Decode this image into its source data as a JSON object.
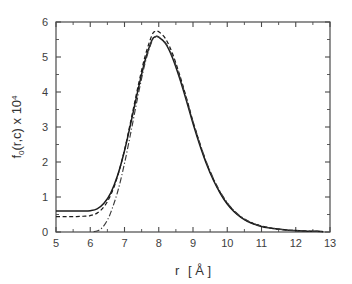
{
  "chart_data": {
    "type": "line",
    "title": "",
    "xlabel": "r [ Å ]",
    "ylabel": "f0(r,c) x 104",
    "ylabel_parts": {
      "base": "f",
      "sub": "0",
      "mid": "(r,c) x 10",
      "sup": "4"
    },
    "xlabel_parts": {
      "var": "r",
      "unit": "[ Å ]"
    },
    "xlim": [
      5,
      13
    ],
    "ylim": [
      0,
      6
    ],
    "xticks": [
      5,
      6,
      7,
      8,
      9,
      10,
      11,
      12,
      13
    ],
    "yticks": [
      0,
      1,
      2,
      3,
      4,
      5,
      6
    ],
    "xticklabels": [
      "5",
      "6",
      "7",
      "8",
      "9",
      "10",
      "11",
      "12",
      "13"
    ],
    "yticklabels": [
      "0",
      "1",
      "2",
      "3",
      "4",
      "5",
      "6"
    ],
    "x_minor_step": 0.5,
    "y_minor_step": 0.5,
    "grid": false,
    "legend": "none",
    "frame": "box",
    "accent_color": "#1c1c1c",
    "background_color": "#ffffff",
    "series": [
      {
        "name": "solid",
        "style": "solid",
        "color": "#1c1c1c",
        "x": [
          5.0,
          5.2,
          5.4,
          5.6,
          5.8,
          6.0,
          6.2,
          6.4,
          6.6,
          6.8,
          7.0,
          7.2,
          7.4,
          7.6,
          7.8,
          7.9,
          8.0,
          8.2,
          8.4,
          8.6,
          8.8,
          9.0,
          9.2,
          9.4,
          9.6,
          9.8,
          10.0,
          10.2,
          10.4,
          10.6,
          10.8,
          11.0,
          11.2,
          11.4,
          11.6,
          11.8,
          12.0,
          12.2,
          12.4,
          12.6,
          12.8
        ],
        "y": [
          0.6,
          0.6,
          0.6,
          0.6,
          0.6,
          0.61,
          0.66,
          0.82,
          1.12,
          1.62,
          2.32,
          3.18,
          4.08,
          4.9,
          5.48,
          5.58,
          5.57,
          5.38,
          4.98,
          4.42,
          3.78,
          3.1,
          2.48,
          1.93,
          1.47,
          1.1,
          0.8,
          0.58,
          0.42,
          0.3,
          0.22,
          0.16,
          0.12,
          0.09,
          0.07,
          0.05,
          0.04,
          0.03,
          0.02,
          0.02,
          0.01
        ]
      },
      {
        "name": "dashed",
        "style": "dashed",
        "color": "#1c1c1c",
        "x": [
          5.0,
          5.2,
          5.4,
          5.6,
          5.8,
          6.0,
          6.2,
          6.4,
          6.6,
          6.8,
          7.0,
          7.2,
          7.4,
          7.6,
          7.8,
          7.9,
          8.0,
          8.2,
          8.4,
          8.6,
          8.8,
          9.0,
          9.2,
          9.4,
          9.6,
          9.8,
          10.0,
          10.2,
          10.4,
          10.6,
          10.8,
          11.0,
          11.2,
          11.4,
          11.6,
          11.8,
          12.0,
          12.2,
          12.4,
          12.6,
          12.8
        ],
        "y": [
          0.44,
          0.44,
          0.44,
          0.44,
          0.45,
          0.47,
          0.54,
          0.72,
          1.06,
          1.6,
          2.34,
          3.25,
          4.18,
          5.02,
          5.62,
          5.73,
          5.72,
          5.52,
          5.1,
          4.52,
          3.86,
          3.16,
          2.52,
          1.96,
          1.5,
          1.12,
          0.82,
          0.6,
          0.43,
          0.31,
          0.23,
          0.17,
          0.12,
          0.09,
          0.07,
          0.05,
          0.04,
          0.03,
          0.02,
          0.02,
          0.01
        ]
      },
      {
        "name": "dash-dot",
        "style": "dashdot",
        "color": "#3a3a3a",
        "x": [
          6.1,
          6.2,
          6.3,
          6.4,
          6.5,
          6.6,
          6.8,
          7.0,
          7.2,
          7.4,
          7.6,
          7.8,
          7.9,
          8.0,
          8.2,
          8.4,
          8.6,
          8.8,
          9.0,
          9.2,
          9.4,
          9.6,
          9.8,
          10.0,
          10.2,
          10.4,
          10.6,
          10.8,
          11.0,
          11.2,
          11.4,
          11.6,
          11.8,
          12.0,
          12.2,
          12.4,
          12.6,
          12.8
        ],
        "y": [
          0.01,
          0.03,
          0.08,
          0.18,
          0.34,
          0.56,
          1.15,
          1.96,
          2.92,
          3.92,
          4.82,
          5.45,
          5.58,
          5.57,
          5.4,
          5.02,
          4.48,
          3.84,
          3.16,
          2.54,
          1.98,
          1.52,
          1.14,
          0.84,
          0.61,
          0.44,
          0.32,
          0.23,
          0.17,
          0.13,
          0.1,
          0.07,
          0.05,
          0.04,
          0.03,
          0.02,
          0.02,
          0.01
        ]
      }
    ]
  }
}
